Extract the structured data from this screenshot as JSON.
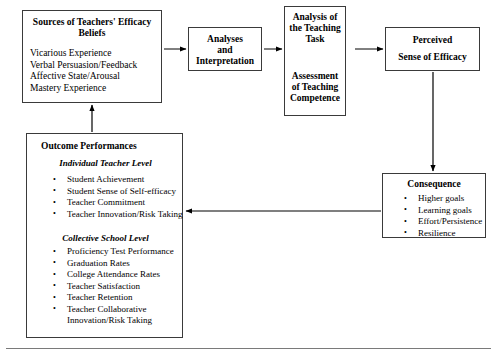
{
  "diagram": {
    "boxes": {
      "sources": {
        "name": "sources-of-efficacy-beliefs",
        "title_line1": "Sources of Teachers' Efficacy",
        "title_line2": "Beliefs",
        "items": [
          "Vicarious Experience",
          "Verbal Persuasion/Feedback",
          "Affective State/Arousal",
          "Mastery Experience"
        ]
      },
      "analyses": {
        "name": "analyses-and-interpretation",
        "line1": "Analyses",
        "line2": "and",
        "line3": "Interpretation"
      },
      "task": {
        "name": "analysis-of-teaching-task",
        "top_line1": "Analysis of",
        "top_line2": "the Teaching",
        "top_line3": "Task",
        "bottom_line1": "Assessment",
        "bottom_line2": "of Teaching",
        "bottom_line3": "Competence"
      },
      "perceived": {
        "name": "perceived-sense-of-efficacy",
        "line1": "Perceived",
        "line2": "Sense of Efficacy"
      },
      "outcome": {
        "name": "outcome-performances",
        "title": "Outcome Performances",
        "subheading_individual": "Individual Teacher Level",
        "individual_items": [
          "Student Achievement",
          "Student Sense of Self-efficacy",
          "Teacher Commitment",
          "Teacher Innovation/Risk Taking"
        ],
        "subheading_collective": "Collective School Level",
        "collective_items": [
          "Proficiency Test Performance",
          "Graduation Rates",
          "College Attendance Rates",
          "Teacher Satisfaction",
          "Teacher Retention",
          "Teacher Collaborative Innovation/Risk Taking"
        ]
      },
      "consequence": {
        "name": "consequence",
        "title": "Consequence",
        "items": [
          "Higher goals",
          "Learning goals",
          "Effort/Persistence",
          "Resilience"
        ]
      }
    },
    "arrows": [
      {
        "name": "arrow-sources-to-analyses",
        "from": "sources",
        "to": "analyses",
        "direction": "right"
      },
      {
        "name": "arrow-analyses-to-task",
        "from": "analyses",
        "to": "task",
        "direction": "right"
      },
      {
        "name": "arrow-task-internal-bidirectional",
        "from": "task-top",
        "to": "task-bottom",
        "direction": "bidirectional-vertical"
      },
      {
        "name": "arrow-task-to-perceived",
        "from": "task",
        "to": "perceived",
        "direction": "right"
      },
      {
        "name": "arrow-perceived-to-consequence",
        "from": "perceived",
        "to": "consequence",
        "direction": "down"
      },
      {
        "name": "arrow-consequence-to-outcome",
        "from": "consequence",
        "to": "outcome",
        "direction": "left"
      },
      {
        "name": "arrow-outcome-to-sources",
        "from": "outcome",
        "to": "sources",
        "direction": "up"
      }
    ],
    "colors": {
      "border": "#3a3a3a",
      "text": "#000000",
      "background": "#ffffff",
      "rule": "#7a7a7a"
    }
  }
}
